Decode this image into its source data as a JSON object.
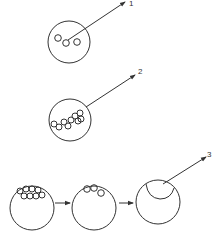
{
  "diagram": {
    "colors": {
      "line": "#333333",
      "background": "#ffffff"
    },
    "labels": [
      {
        "id": "label-1",
        "text": "1",
        "x": 129,
        "y": 6
      },
      {
        "id": "label-2",
        "text": "2",
        "x": 138,
        "y": 74
      },
      {
        "id": "label-3",
        "text": "3",
        "x": 207,
        "y": 157
      }
    ],
    "panels": [
      {
        "id": "panel-1",
        "description": "cell with few small particles, arrow labeled 1"
      },
      {
        "id": "panel-2",
        "description": "cell with chain of particles, arrow labeled 2"
      },
      {
        "id": "panel-3",
        "description": "sequence: cell with clustered particles -> cell with fewer particles -> cell with vacuole, arrow labeled 3"
      }
    ]
  }
}
